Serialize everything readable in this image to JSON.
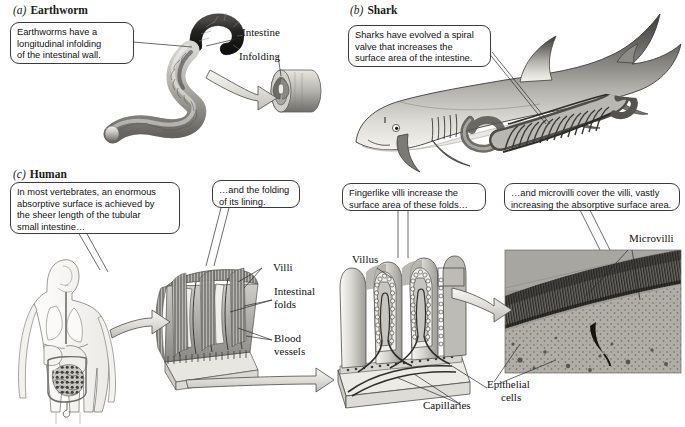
{
  "figure": {
    "background": "#ffffff",
    "ink": "#1a1a1a"
  },
  "panels": [
    {
      "letter": "(a)",
      "name": "Earthworm"
    },
    {
      "letter": "(b)",
      "name": "Shark"
    },
    {
      "letter": "(c)",
      "name": "Human"
    }
  ],
  "callouts": {
    "earthworm": [
      "Earthworms have a",
      "longitudinal infolding",
      "of the intestinal wall."
    ],
    "shark": [
      "Sharks have evolved a spiral",
      "valve that increases the",
      "surface area of the intestine."
    ],
    "human_intro": [
      "In most vertebrates, an enormous",
      "absorptive surface is achieved by",
      "the sheer length of the tubular",
      "small intestine…"
    ],
    "folding": [
      "…and the folding",
      "of its lining."
    ],
    "villi": [
      "Fingerlike villi increase the",
      "surface area of these folds…"
    ],
    "microvilli": [
      "…and microvilli cover the villi, vastly",
      "increasing the absorptive surface area."
    ]
  },
  "labels": {
    "intestine": "Intestine",
    "infolding": "Infolding",
    "villi": "Villi",
    "intestinal_folds_l1": "Intestinal",
    "intestinal_folds_l2": "folds",
    "blood_vessels_l1": "Blood",
    "blood_vessels_l2": "vessels",
    "villus": "Villus",
    "capillaries": "Capillaries",
    "epithelial_l1": "Epithelial",
    "epithelial_l2": "cells",
    "microvilli": "Microvilli"
  },
  "illustrations": {
    "earthworm_body": "earthworm-intestine-drawing",
    "earthworm_cross_section": "intestine-cross-section-infolding",
    "shark_body": "shark-with-spiral-valve-drawing",
    "human_torso": "human-torso-digestive-system-drawing",
    "intestinal_wall_block": "intestinal-folds-block-drawing",
    "villus_block": "villus-cross-section-block-drawing",
    "micrograph": "microvilli-electron-micrograph"
  },
  "colors": {
    "line": "#2b2b2b",
    "balloon_border": "#3b3b3b",
    "arrow_fill": "#e3e3e3",
    "arrow_stroke": "#4a4a4a",
    "micrograph_bg": "#9a9a9a",
    "tissue_light": "#d9d7d2",
    "tissue_mid": "#9b9b9b",
    "tissue_dark": "#4e4e4e"
  }
}
